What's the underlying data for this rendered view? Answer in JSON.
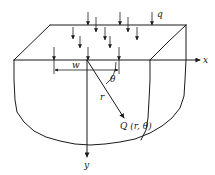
{
  "figure": {
    "colors": {
      "ink": "#1a1a1a",
      "background": "#ffffff"
    },
    "labels": {
      "load": "q",
      "x_axis": "x",
      "y_axis": "y",
      "width": "w",
      "angle": "θ",
      "radius": "r",
      "point": "Q (r, θ)"
    },
    "geometry": {
      "surface_top_back_left": [
        50,
        25
      ],
      "surface_top_back_right": [
        186,
        25
      ],
      "surface_front_left": [
        14,
        60
      ],
      "surface_front_right": [
        150,
        60
      ],
      "origin": [
        87,
        60
      ],
      "point_Q": [
        124,
        118
      ],
      "load_strip_x_range": [
        54,
        119
      ],
      "x_axis_end": [
        200,
        60
      ],
      "y_axis_end": [
        87,
        157
      ]
    },
    "load_arrows": [
      {
        "x": 88,
        "y1": 12,
        "y2": 25
      },
      {
        "x": 96,
        "y1": 17,
        "y2": 32
      },
      {
        "x": 120,
        "y1": 12,
        "y2": 25
      },
      {
        "x": 128,
        "y1": 17,
        "y2": 32
      },
      {
        "x": 152,
        "y1": 12,
        "y2": 25
      },
      {
        "x": 73,
        "y1": 27,
        "y2": 39
      },
      {
        "x": 105,
        "y1": 27,
        "y2": 40
      },
      {
        "x": 137,
        "y1": 27,
        "y2": 40
      },
      {
        "x": 80,
        "y1": 36,
        "y2": 48
      },
      {
        "x": 110,
        "y1": 36,
        "y2": 48
      },
      {
        "x": 54,
        "y1": 47,
        "y2": 60
      },
      {
        "x": 88,
        "y1": 47,
        "y2": 60
      },
      {
        "x": 119,
        "y1": 47,
        "y2": 60
      }
    ]
  }
}
